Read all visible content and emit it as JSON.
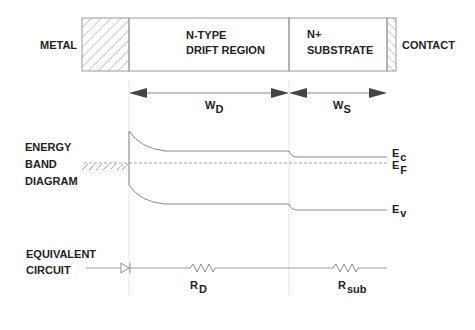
{
  "structure": {
    "metal_label": "METAL",
    "drift_label_1": "N-TYPE",
    "drift_label_2": "DRIFT REGION",
    "substrate_label_1": "N+",
    "substrate_label_2": "SUBSTRATE",
    "contact_label": "CONTACT"
  },
  "dimensions": {
    "wd_main": "W",
    "wd_sub": "D",
    "ws_main": "W",
    "ws_sub": "S"
  },
  "energy_band": {
    "title_1": "ENERGY",
    "title_2": "BAND",
    "title_3": "DIAGRAM",
    "ec_main": "E",
    "ec_sub": "c",
    "ef_main": "E",
    "ef_sub": "F",
    "ev_main": "E",
    "ev_sub": "v"
  },
  "circuit": {
    "title_1": "EQUIVALENT",
    "title_2": "CIRCUIT",
    "rd_main": "R",
    "rd_sub": "D",
    "rsub_main": "R",
    "rsub_sub": "sub"
  },
  "colors": {
    "line": "#888888",
    "text": "#222222",
    "arrow": "#444444"
  }
}
